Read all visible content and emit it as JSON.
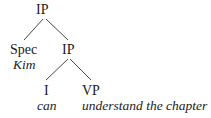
{
  "tree": {
    "root": {
      "label": "IP"
    },
    "spec": {
      "label": "Spec",
      "word": "Kim"
    },
    "ip2": {
      "label": "IP"
    },
    "i": {
      "label": "I",
      "word": "can"
    },
    "vp": {
      "label": "VP",
      "word": "understand the chapter"
    }
  },
  "edges": [
    {
      "from": "IP",
      "to": "Spec"
    },
    {
      "from": "IP",
      "to": "IP"
    },
    {
      "from": "IP",
      "to": "I"
    },
    {
      "from": "IP",
      "to": "VP"
    }
  ]
}
